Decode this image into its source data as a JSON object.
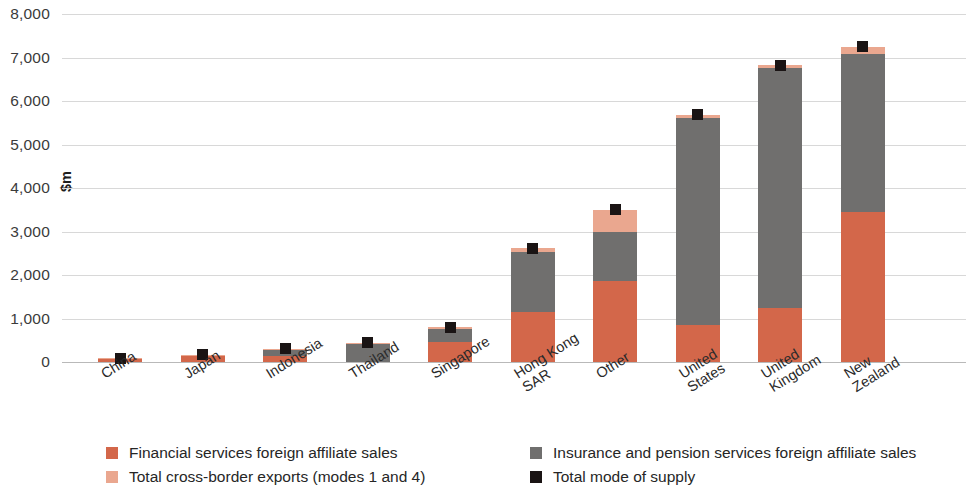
{
  "chart_data": {
    "type": "bar",
    "subtype": "stacked-bar-with-marker",
    "title": "",
    "xlabel": "",
    "ylabel": "$m",
    "ylim": [
      0,
      8000
    ],
    "ytick_labels": [
      "8,000",
      "7,000",
      "6,000",
      "5,000",
      "4,000",
      "3,000",
      "2,000",
      "1,000",
      "0"
    ],
    "ytick_values": [
      8000,
      7000,
      6000,
      5000,
      4000,
      3000,
      2000,
      1000,
      0
    ],
    "grid": true,
    "legend_position": "bottom",
    "categories": [
      "China",
      "Japan",
      "Indonesia",
      "Thailand",
      "Singapore",
      "Hong Kong SAR",
      "Other",
      "United States",
      "United Kingdom",
      "New Zealand"
    ],
    "category_lines": [
      [
        "China"
      ],
      [
        "Japan"
      ],
      [
        "Indonesia"
      ],
      [
        "Thailand"
      ],
      [
        "Singapore"
      ],
      [
        "Hong Kong",
        "SAR"
      ],
      [
        "Other"
      ],
      [
        "United",
        "States"
      ],
      [
        "United",
        "Kingdom"
      ],
      [
        "New",
        "Zealand"
      ]
    ],
    "series": [
      {
        "name": "Financial services foreign affiliate sales",
        "color": "#d3674a",
        "values": [
          60,
          135,
          140,
          0,
          470,
          1150,
          1870,
          840,
          1250,
          3450
        ]
      },
      {
        "name": "Insurance and pension services foreign affiliate sales",
        "color": "#706f6e",
        "values": [
          0,
          0,
          140,
          420,
          290,
          1390,
          1130,
          4780,
          5500,
          3630
        ]
      },
      {
        "name": "Total cross-border exports (modes 1 and 4)",
        "color": "#eaa78f",
        "values": [
          20,
          35,
          30,
          20,
          40,
          70,
          500,
          60,
          70,
          170
        ]
      }
    ],
    "marker_series": {
      "name": "Total mode of supply",
      "color": "#1a1414",
      "values": [
        80,
        170,
        310,
        440,
        800,
        2610,
        3500,
        5680,
        6820,
        7250
      ]
    }
  },
  "legend": {
    "entries": [
      {
        "label": "Financial services foreign affiliate sales",
        "swatch": "financial-services-swatch"
      },
      {
        "label": "Insurance and pension services foreign affiliate sales",
        "swatch": "insurance-pension-swatch"
      },
      {
        "label": "Total cross-border exports (modes 1 and 4)",
        "swatch": "cross-border-exports-swatch"
      },
      {
        "label": "Total mode of supply",
        "swatch": "total-mode-of-supply-swatch"
      }
    ]
  }
}
